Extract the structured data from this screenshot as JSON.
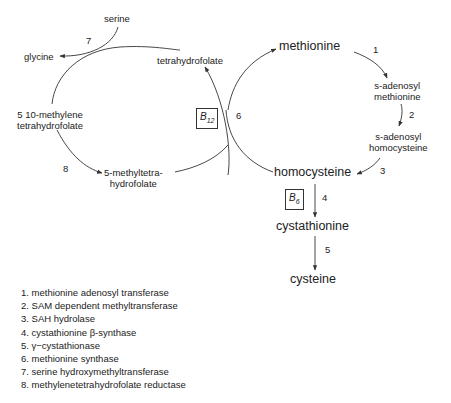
{
  "diagram": {
    "metabolites": {
      "serine": "serine",
      "glycine": "glycine",
      "tetrahydrofolate": "tetrahydrofolate",
      "methylene_thf_line1": "5 10-methylene",
      "methylene_thf_line2": "tetrahydrofolate",
      "methyl_thf_line1": "5-methyltetra-",
      "methyl_thf_line2": "hydrofolate",
      "methionine": "methionine",
      "sam_line1": "s-adenosyl",
      "sam_line2": "methionine",
      "sah_line1": "s-adenosyl",
      "sah_line2": "homocysteine",
      "homocysteine": "homocysteine",
      "cystathionine": "cystathionine",
      "cysteine": "cysteine"
    },
    "cofactors": {
      "b12_base": "B",
      "b12_sub": "12",
      "b6_base": "B",
      "b6_sub": "6"
    },
    "step_numbers": {
      "s1": "1",
      "s2": "2",
      "s3": "3",
      "s4": "4",
      "s5": "5",
      "s6": "6",
      "s7": "7",
      "s8": "8"
    },
    "legend": [
      "1. methionine adenosyl transferase",
      "2. SAM dependent methyltransferase",
      "3. SAH hydrolase",
      "4. cystathionine β-synthase",
      "5. γ−cystathionase",
      "6. methionine synthase",
      "7. serine hydroxymethyltransferase",
      "8. methylenetetrahydrofolate reductase"
    ],
    "colors": {
      "line": "#333333",
      "text": "#222222"
    }
  }
}
